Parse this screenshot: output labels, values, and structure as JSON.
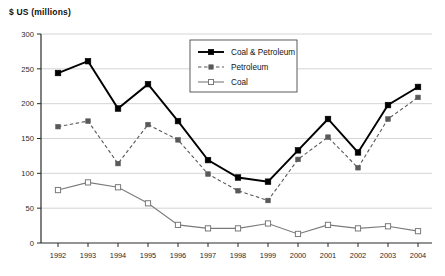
{
  "chart_data": {
    "type": "line",
    "title": "$ US (millions)",
    "xlabel": "",
    "ylabel": "$ US (millions)",
    "categories": [
      "1992",
      "1993",
      "1994",
      "1995",
      "1996",
      "1997",
      "1998",
      "1999",
      "2000",
      "2001",
      "2002",
      "2003",
      "2004"
    ],
    "xlim": [
      1992,
      2004
    ],
    "ylim": [
      0,
      300
    ],
    "yticks": [
      0,
      50,
      100,
      150,
      200,
      250,
      300
    ],
    "grid": true,
    "legend_position": "top-center",
    "series": [
      {
        "name": "Coal & Petroleum",
        "values": [
          244,
          261,
          193,
          228,
          175,
          119,
          94,
          88,
          133,
          178,
          130,
          198,
          224
        ],
        "color": "#000000",
        "dash": "solid",
        "marker": "filled-square"
      },
      {
        "name": "Petroleum",
        "values": [
          167,
          175,
          114,
          170,
          148,
          99,
          75,
          61,
          120,
          152,
          108,
          178,
          209
        ],
        "color": "#595959",
        "dash": "dashed",
        "marker": "filled-square"
      },
      {
        "name": "Coal",
        "values": [
          76,
          87,
          80,
          57,
          26,
          21,
          21,
          28,
          13,
          26,
          21,
          24,
          17
        ],
        "color": "#7a7a7a",
        "dash": "solid",
        "marker": "open-square"
      }
    ]
  },
  "legend": {
    "items": [
      {
        "label": "Coal & Petroleum"
      },
      {
        "label": "Petroleum"
      },
      {
        "label": "Coal"
      }
    ]
  },
  "axes": {
    "y_tick_labels": [
      "0",
      "50",
      "100",
      "150",
      "200",
      "250",
      "300"
    ],
    "x_tick_labels": [
      "1992",
      "1993",
      "1994",
      "1995",
      "1996",
      "1997",
      "1998",
      "1999",
      "2000",
      "2001",
      "2002",
      "2003",
      "2004"
    ]
  },
  "colors": {
    "axis": "#2b2b2b",
    "grid": "#c9c9c9",
    "background": "#ffffff",
    "series_coal_petroleum": "#000000",
    "series_petroleum": "#595959",
    "series_coal": "#7a7a7a"
  }
}
